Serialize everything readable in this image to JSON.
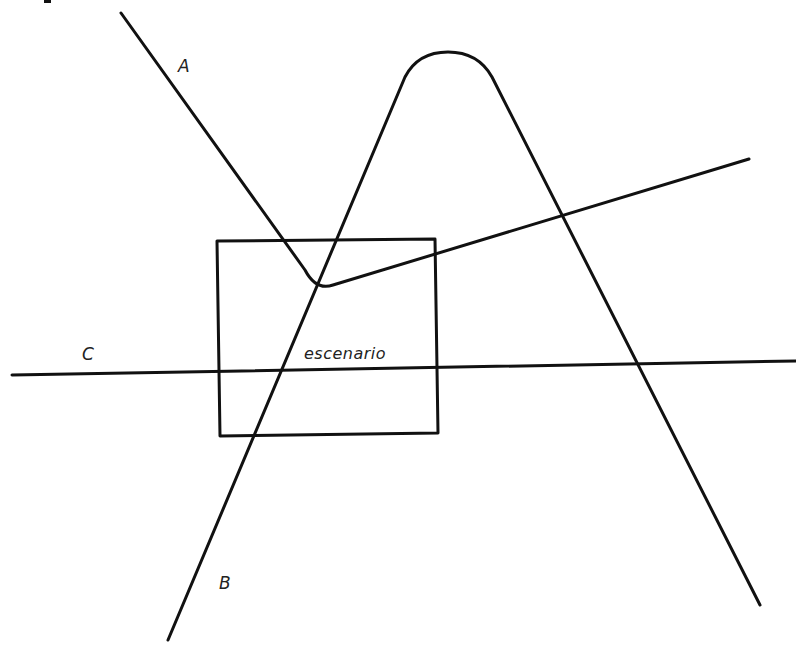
{
  "diagram": {
    "labels": {
      "path_a": "A",
      "path_b": "B",
      "path_c": "C",
      "region": "escenario"
    },
    "elements": [
      {
        "id": "path-a",
        "label": "A",
        "description": "Line from upper-left descending to a rounded vertex inside the rectangle, then rising to the right"
      },
      {
        "id": "path-b",
        "label": "B",
        "description": "Inverted-V curve with rounded apex at top, left leg crossing the rectangle, right leg descending to bottom-right"
      },
      {
        "id": "path-c",
        "label": "C",
        "description": "Near-horizontal line crossing the full width through the lower part of the rectangle"
      },
      {
        "id": "stage",
        "label": "escenario",
        "description": "Rectangle representing the stage"
      }
    ],
    "colors": {
      "stroke": "#111111",
      "background": "#ffffff"
    }
  }
}
